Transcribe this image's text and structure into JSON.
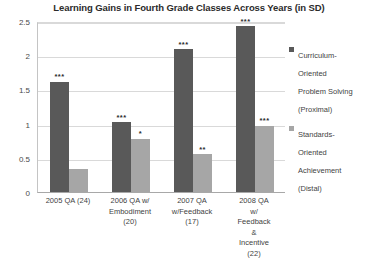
{
  "chart_data": {
    "type": "bar",
    "title": "Learning Gains in Fourth Grade Classes Across Years (in SD)",
    "xlabel": "",
    "ylabel": "",
    "ylim": [
      0,
      2.5
    ],
    "yticks": [
      0,
      0.5,
      1,
      1.5,
      2,
      2.5
    ],
    "ytick_labels": [
      "0",
      "0.5",
      "1",
      "1.5",
      "2",
      "2.5"
    ],
    "grid": true,
    "legend_position": "right",
    "categories": [
      "2005 QA (24)",
      "2006 QA w/ Embodiment (20)",
      "2007 QA w/Feedback (17)",
      "2008 QA w/ Feedback & Incentive (22)"
    ],
    "category_lines": [
      [
        "2005 QA (24)"
      ],
      [
        "2006 QA w/",
        "Embodiment",
        "(20)"
      ],
      [
        "2007 QA",
        "w/Feedback",
        "(17)"
      ],
      [
        "2008 QA w/",
        "Feedback &",
        "Incentive (22)"
      ]
    ],
    "series": [
      {
        "name": "Curriculum-Oriented Problem Solving (Proximal)",
        "legend_lines": "Curriculum-\nOriented\nProblem Solving\n(Proximal)",
        "color": "#595959",
        "values": [
          1.61,
          1.02,
          2.09,
          2.42
        ],
        "annotations": [
          "***",
          "***",
          "***",
          "***"
        ]
      },
      {
        "name": "Standards-Oriented Achievement (Distal)",
        "legend_lines": "Standards-\nOriented\nAchievement\n(Distal)",
        "color": "#a6a6a6",
        "values": [
          0.33,
          0.78,
          0.55,
          0.97
        ],
        "annotations": [
          "",
          "*",
          "**",
          "***"
        ]
      }
    ]
  }
}
